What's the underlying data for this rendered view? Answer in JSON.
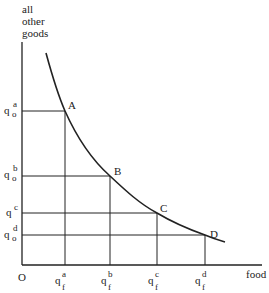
{
  "diagram": {
    "type": "indifference-curve",
    "y_axis_label_lines": [
      "all",
      "other",
      "goods"
    ],
    "x_axis_label": "food",
    "origin_label": "O",
    "points": [
      {
        "name": "A",
        "y_label": {
          "base": "q",
          "sub": "o",
          "sup": "a"
        },
        "x_label": {
          "base": "q",
          "sub": "f",
          "sup": "a"
        }
      },
      {
        "name": "B",
        "y_label": {
          "base": "q",
          "sub": "o",
          "sup": "b"
        },
        "x_label": {
          "base": "q",
          "sub": "f",
          "sup": "b"
        }
      },
      {
        "name": "C",
        "y_label": {
          "base": "q",
          "sub": "",
          "sup": "c"
        },
        "x_label": {
          "base": "q",
          "sub": "f",
          "sup": "c"
        }
      },
      {
        "name": "D",
        "y_label": {
          "base": "q",
          "sub": "o",
          "sup": "d"
        },
        "x_label": {
          "base": "q",
          "sub": "f",
          "sup": "d"
        }
      }
    ]
  }
}
